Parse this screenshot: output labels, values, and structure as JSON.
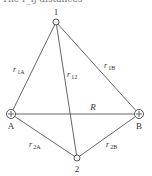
{
  "header_fragment": "The r_ij distances",
  "nodes": {
    "n1": {
      "label": "1",
      "x": 56,
      "y": 22,
      "type": "electron"
    },
    "n2": {
      "label": "2",
      "x": 77,
      "y": 158,
      "type": "electron"
    },
    "A": {
      "label": "A",
      "x": 11,
      "y": 114,
      "type": "nucleus"
    },
    "B": {
      "label": "B",
      "x": 139,
      "y": 114,
      "type": "nucleus"
    }
  },
  "edges": [
    {
      "from": "n1",
      "to": "A",
      "label_main": "r",
      "label_sub": "1A"
    },
    {
      "from": "n1",
      "to": "B",
      "label_main": "r",
      "label_sub": "1B"
    },
    {
      "from": "n1",
      "to": "n2",
      "label_main": "r",
      "label_sub": "12"
    },
    {
      "from": "A",
      "to": "B",
      "label_main": "R",
      "label_sub": ""
    },
    {
      "from": "A",
      "to": "n2",
      "label_main": "r",
      "label_sub": "2A"
    },
    {
      "from": "B",
      "to": "n2",
      "label_main": "r",
      "label_sub": "2B"
    }
  ],
  "labels": {
    "n1": "1",
    "n2": "2",
    "A": "A",
    "B": "B",
    "r": "r",
    "R": "R",
    "sub_1A": "1A",
    "sub_1B": "1B",
    "sub_12": "12",
    "sub_2A": "2A",
    "sub_2B": "2B"
  }
}
